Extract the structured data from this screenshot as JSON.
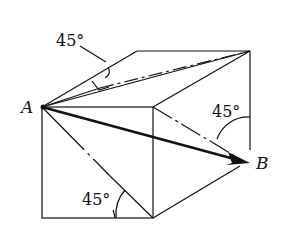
{
  "diagram": {
    "title": "",
    "points": {
      "A": "A",
      "B": "B"
    },
    "angles": {
      "top": "45°",
      "right": "45°",
      "bottom": "45°"
    },
    "vector": "A to B",
    "colors": {
      "line": "#111111",
      "background": "#ffffff"
    }
  }
}
